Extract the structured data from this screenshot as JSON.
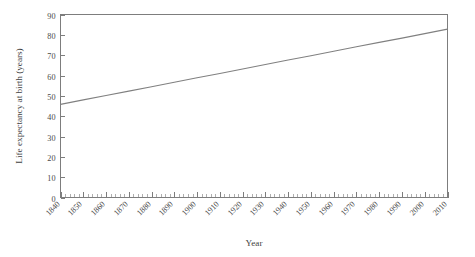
{
  "chart_data": {
    "type": "line",
    "title": "",
    "xlabel": "Year",
    "ylabel": "Life expectancy at birth (years)",
    "xlim": [
      1840,
      2010
    ],
    "ylim": [
      0,
      90
    ],
    "grid": false,
    "legend": null,
    "line_color": "#808080",
    "axis_color": "#7d7d7d",
    "x_tick_labels": [
      "1840",
      "1850",
      "1860",
      "1870",
      "1880",
      "1890",
      "1900",
      "1910",
      "1920",
      "1930",
      "1940",
      "1950",
      "1960",
      "1970",
      "1980",
      "1990",
      "2000",
      "2010"
    ],
    "x_tick_values": [
      1840,
      1850,
      1860,
      1870,
      1880,
      1890,
      1900,
      1910,
      1920,
      1930,
      1940,
      1950,
      1960,
      1970,
      1980,
      1990,
      2000,
      2010
    ],
    "x_tick_rotation": 45,
    "x_minor_tick_step": 2,
    "y_tick_labels": [
      "0",
      "10",
      "20",
      "30",
      "40",
      "50",
      "60",
      "70",
      "80",
      "90"
    ],
    "y_tick_values": [
      0,
      10,
      20,
      30,
      40,
      50,
      60,
      70,
      80,
      90
    ],
    "series": [
      {
        "name": "Life expectancy at birth",
        "x": [
          1840,
          1850,
          1860,
          1870,
          1880,
          1890,
          1900,
          1910,
          1920,
          1930,
          1940,
          1950,
          1960,
          1970,
          1980,
          1990,
          2000,
          2010
        ],
        "values": [
          45.8,
          48.0,
          50.2,
          52.3,
          54.5,
          56.7,
          58.9,
          61.0,
          63.2,
          65.4,
          67.6,
          69.7,
          71.9,
          74.1,
          76.3,
          78.4,
          80.6,
          82.8
        ]
      }
    ],
    "annotations": []
  }
}
